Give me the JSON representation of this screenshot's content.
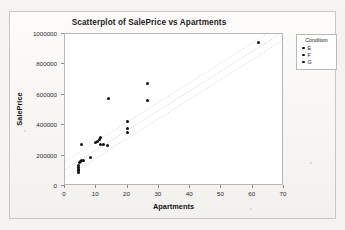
{
  "scan": {
    "top_strip_text": ""
  },
  "chart": {
    "title": "Scatterplot of SalePrice vs Apartments",
    "xlabel": "Apartments",
    "ylabel": "SalePrice"
  },
  "legend": {
    "title": "Condition",
    "items": [
      {
        "label": "E",
        "color": "#111111"
      },
      {
        "label": "F",
        "color": "#111111"
      },
      {
        "label": "G",
        "color": "#111111"
      }
    ]
  },
  "chart_data": {
    "type": "scatter",
    "title": "Scatterplot of SalePrice vs Apartments",
    "xlabel": "Apartments",
    "ylabel": "SalePrice",
    "xlim": [
      0,
      70
    ],
    "ylim": [
      0,
      1000000
    ],
    "xticks": [
      0,
      10,
      20,
      30,
      40,
      50,
      60,
      70
    ],
    "yticks": [
      0,
      200000,
      400000,
      600000,
      800000,
      1000000
    ],
    "grid": false,
    "legend": {
      "title": "Condition",
      "position": "right-outside",
      "entries": [
        "E",
        "F",
        "G"
      ]
    },
    "series": [
      {
        "name": "Condition",
        "marker": "filled-circle",
        "color": "#111111",
        "points": [
          {
            "x": 4.2,
            "y": 90000,
            "condition": "G"
          },
          {
            "x": 4.2,
            "y": 100000,
            "condition": "G"
          },
          {
            "x": 4.2,
            "y": 110000,
            "condition": "G"
          },
          {
            "x": 4.3,
            "y": 122000,
            "condition": "G"
          },
          {
            "x": 4.3,
            "y": 133000,
            "condition": "G"
          },
          {
            "x": 4.6,
            "y": 152000,
            "condition": "F"
          },
          {
            "x": 5.0,
            "y": 160000,
            "condition": "F"
          },
          {
            "x": 5.4,
            "y": 166000,
            "condition": "F"
          },
          {
            "x": 5.9,
            "y": 171000,
            "condition": "F"
          },
          {
            "x": 8.0,
            "y": 190000,
            "condition": "F"
          },
          {
            "x": 5.2,
            "y": 272000,
            "condition": "E"
          },
          {
            "x": 9.8,
            "y": 283000,
            "condition": "F"
          },
          {
            "x": 10.4,
            "y": 293000,
            "condition": "F"
          },
          {
            "x": 11.0,
            "y": 305000,
            "condition": "F"
          },
          {
            "x": 11.2,
            "y": 322000,
            "condition": "E"
          },
          {
            "x": 11.4,
            "y": 272000,
            "condition": "F"
          },
          {
            "x": 12.3,
            "y": 276000,
            "condition": "F"
          },
          {
            "x": 13.6,
            "y": 268000,
            "condition": "F"
          },
          {
            "x": 13.9,
            "y": 575000,
            "condition": "E"
          },
          {
            "x": 20.0,
            "y": 350000,
            "condition": "F"
          },
          {
            "x": 20.0,
            "y": 378000,
            "condition": "F"
          },
          {
            "x": 20.1,
            "y": 423000,
            "condition": "E"
          },
          {
            "x": 26.3,
            "y": 560000,
            "condition": "E"
          },
          {
            "x": 26.4,
            "y": 672000,
            "condition": "E"
          },
          {
            "x": 62.0,
            "y": 943000,
            "condition": "E"
          }
        ]
      }
    ],
    "fit": {
      "type": "linear-regression",
      "line": {
        "x1": 0,
        "y1": 95000,
        "x2": 70,
        "y2": 1010000
      },
      "bands": [
        {
          "name": "upper",
          "x1": 0,
          "y1": 150000,
          "x2": 70,
          "y2": 1065000
        },
        {
          "name": "lower",
          "x1": 0,
          "y1": 40000,
          "x2": 70,
          "y2": 955000
        }
      ],
      "style": "dotted-light-gray"
    }
  }
}
